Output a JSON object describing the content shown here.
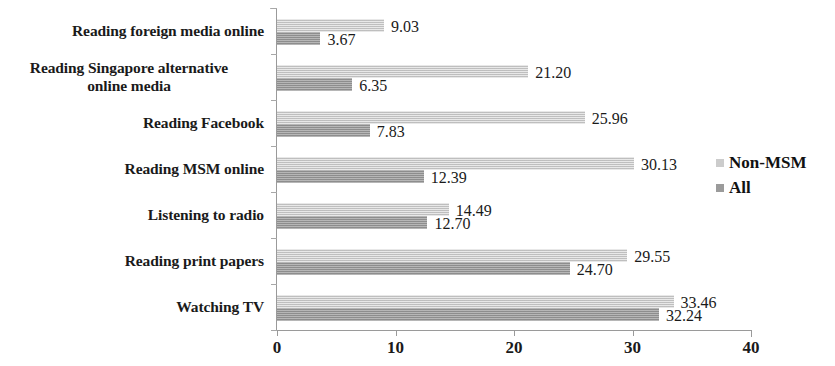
{
  "chart_data": {
    "type": "bar",
    "orientation": "horizontal",
    "title": "",
    "xlabel": "",
    "ylabel": "",
    "xlim": [
      0,
      40
    ],
    "xticks": [
      "0",
      "10",
      "20",
      "30",
      "40"
    ],
    "grid": false,
    "legend_position": "right",
    "categories": [
      "Reading foreign media online",
      "Reading Singapore alternative online media",
      "Reading Facebook",
      "Reading MSM online",
      "Listening  to radio",
      "Reading print papers",
      "Watching TV"
    ],
    "category_lines": [
      [
        "Reading foreign media online"
      ],
      [
        "Reading Singapore alternative",
        "online media"
      ],
      [
        "Reading Facebook"
      ],
      [
        "Reading MSM online"
      ],
      [
        "Listening  to radio"
      ],
      [
        "Reading print papers"
      ],
      [
        "Watching TV"
      ]
    ],
    "series": [
      {
        "name": "Non-MSM",
        "color": "#cccccc",
        "values": [
          9.03,
          21.2,
          25.96,
          30.13,
          14.49,
          29.55,
          33.46
        ],
        "labels": [
          "9.03",
          "21.20",
          "25.96",
          "30.13",
          "14.49",
          "29.55",
          "33.46"
        ]
      },
      {
        "name": "All",
        "color": "#9b9b9b",
        "values": [
          3.67,
          6.35,
          7.83,
          12.39,
          12.7,
          24.7,
          32.24
        ],
        "labels": [
          "3.67",
          "6.35",
          "7.83",
          "12.39",
          "12.70",
          "24.70",
          "32.24"
        ]
      }
    ]
  },
  "legend": {
    "items": [
      {
        "label": "Non-MSM",
        "color": "#cccccc"
      },
      {
        "label": "All",
        "color": "#9b9b9b"
      }
    ]
  },
  "axis": {
    "x_tick_labels": [
      "0",
      "10",
      "20",
      "30",
      "40"
    ]
  }
}
